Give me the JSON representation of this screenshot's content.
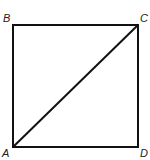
{
  "diagram": {
    "type": "geometry",
    "vertices": [
      {
        "label": "A",
        "position": "bottom-left"
      },
      {
        "label": "B",
        "position": "top-left"
      },
      {
        "label": "C",
        "position": "top-right"
      },
      {
        "label": "D",
        "position": "bottom-right"
      }
    ],
    "edges": [
      "AB",
      "BC",
      "CD",
      "DA"
    ],
    "diagonals": [
      "AC"
    ],
    "colors": {
      "stroke": "#111111",
      "label": "#222222",
      "background": "#ffffff"
    }
  }
}
